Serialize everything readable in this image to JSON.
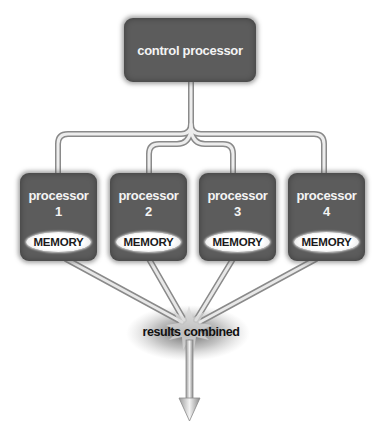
{
  "diagram": {
    "control": {
      "label": "control processor"
    },
    "processors": [
      {
        "label": "processor",
        "number": "1",
        "memory": "MEMORY"
      },
      {
        "label": "processor",
        "number": "2",
        "memory": "MEMORY"
      },
      {
        "label": "processor",
        "number": "3",
        "memory": "MEMORY"
      },
      {
        "label": "processor",
        "number": "4",
        "memory": "MEMORY"
      }
    ],
    "results": {
      "label": "results combined"
    },
    "colors": {
      "box": "#5c5c5c",
      "box_text": "#f4f4f4",
      "memory_bg": "#ffffff",
      "pipe": "#c8c8c8",
      "pipe_edge": "#8a8a8a"
    }
  }
}
